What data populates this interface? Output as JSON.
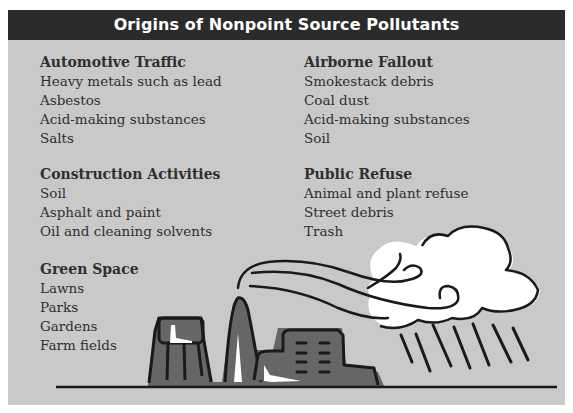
{
  "title": "Origins of Nonpoint Source Pollutants",
  "colors": {
    "header_bg": "#2b2b2b",
    "header_text": "#ffffff",
    "panel_bg": "#c9c9c9",
    "text": "#2f2f2f",
    "factory_fill": "#666666",
    "outline": "#1a1a1a",
    "cloud": "#ffffff"
  },
  "groups": {
    "automotive": {
      "title": "Automotive Traffic",
      "items": [
        "Heavy metals such as lead",
        "Asbestos",
        "Acid-making substances",
        "Salts"
      ]
    },
    "airborne": {
      "title": "Airborne Fallout",
      "items": [
        "Smokestack debris",
        "Coal dust",
        "Acid-making substances",
        "Soil"
      ]
    },
    "construction": {
      "title": "Construction Activities",
      "items": [
        "Soil",
        "Asphalt and paint",
        "Oil and cleaning solvents"
      ]
    },
    "refuse": {
      "title": "Public Refuse",
      "items": [
        "Animal and plant refuse",
        "Street debris",
        "Trash"
      ]
    },
    "green": {
      "title": "Green Space",
      "items": [
        "Lawns",
        "Parks",
        "Gardens",
        "Farm fields"
      ]
    }
  },
  "illustration": {
    "elements": [
      "factory-buildings-icon",
      "smokestack-icon",
      "smoke-plume-icon",
      "cloud-icon",
      "rain-icon",
      "ground-line"
    ]
  }
}
